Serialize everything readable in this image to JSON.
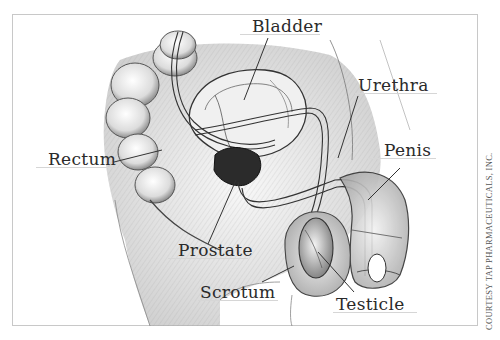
{
  "diagram": {
    "type": "anatomical-illustration",
    "style": "pencil sketch, grayscale",
    "labels": [
      {
        "id": "bladder",
        "text": "Bladder"
      },
      {
        "id": "urethra",
        "text": "Urethra"
      },
      {
        "id": "penis",
        "text": "Penis"
      },
      {
        "id": "rectum",
        "text": "Rectum"
      },
      {
        "id": "prostate",
        "text": "Prostate"
      },
      {
        "id": "scrotum",
        "text": "Scrotum"
      },
      {
        "id": "testicle",
        "text": "Testicle"
      }
    ],
    "credit": "COURTESY TAP PHARMACEUTICALS, INC."
  },
  "colors": {
    "background": "#ffffff",
    "frame": "#c8c8c8",
    "ink": "#2a2a2a",
    "shade": "#8a8a8a",
    "prostate": "#2b2b2b"
  }
}
